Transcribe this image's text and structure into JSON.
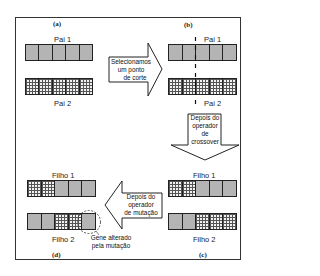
{
  "panels": {
    "a": {
      "label": "(a)",
      "chromosomes": [
        {
          "name": "Pai 1",
          "genes": [
            "solid",
            "solid",
            "solid",
            "solid",
            "solid"
          ]
        },
        {
          "name": "Pai 2",
          "genes": [
            "grid",
            "grid",
            "grid",
            "grid",
            "grid"
          ]
        }
      ]
    },
    "b": {
      "label": "(b)",
      "chromosomes": [
        {
          "name": "Pai 1",
          "genes": [
            "solid",
            "solid",
            "solid",
            "solid",
            "solid"
          ]
        },
        {
          "name": "Pai 2",
          "genes": [
            "grid",
            "grid",
            "grid",
            "grid",
            "grid"
          ]
        }
      ],
      "cut_after_gene": 2
    },
    "c": {
      "label": "(c)",
      "chromosomes": [
        {
          "name": "Filho 1",
          "genes": [
            "grid",
            "grid",
            "solid",
            "solid",
            "solid"
          ]
        },
        {
          "name": "Filho 2",
          "genes": [
            "solid",
            "solid",
            "grid",
            "grid",
            "grid"
          ]
        }
      ]
    },
    "d": {
      "label": "(d)",
      "chromosomes": [
        {
          "name": "Filho 1",
          "genes": [
            "grid",
            "grid",
            "solid",
            "solid",
            "solid"
          ]
        },
        {
          "name": "Filho 2",
          "genes": [
            "solid",
            "solid",
            "grid",
            "grid",
            "solid"
          ]
        }
      ],
      "mutated_gene_index": 4
    }
  },
  "arrows": {
    "a_to_b": {
      "direction": "right",
      "lines": [
        "Selecionamos",
        "um ponto",
        "de corte"
      ]
    },
    "b_to_c": {
      "direction": "down",
      "lines": [
        "Depois do",
        "operador",
        "de",
        "crossover"
      ]
    },
    "c_to_d": {
      "direction": "left",
      "lines": [
        "Depois do",
        "operador",
        "de mutação"
      ]
    }
  },
  "annotation": {
    "lines": [
      "Gene alterado",
      "pela mutação"
    ]
  },
  "colors": {
    "solid_gene": "#b4b4b4",
    "grid_gene_line": "#555555",
    "stroke": "#222222"
  }
}
